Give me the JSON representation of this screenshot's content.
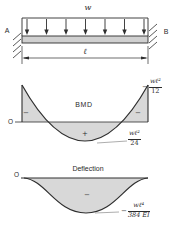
{
  "figure": {
    "beam": {
      "load_label": "w",
      "support_left_label": "A",
      "support_right_label": "B",
      "span_label": "ℓ"
    },
    "bmd": {
      "title": "BMD",
      "origin_label": "O",
      "left_sign": "−",
      "right_sign": "−",
      "center_sign": "+",
      "support_moment": {
        "sign": "−",
        "numerator": "wℓ²",
        "denominator": "12"
      },
      "midspan_moment": {
        "numerator": "wℓ²",
        "denominator": "24"
      }
    },
    "deflection": {
      "title": "Deflection",
      "origin_label": "O",
      "center_sign": "−",
      "max_deflection": {
        "sign": "−",
        "numerator": "wℓ⁴",
        "denominator": "384 EI"
      }
    },
    "colors": {
      "shade": "#d8d8d8",
      "line": "#2e2e2e",
      "text": "#2b2b2b"
    }
  }
}
